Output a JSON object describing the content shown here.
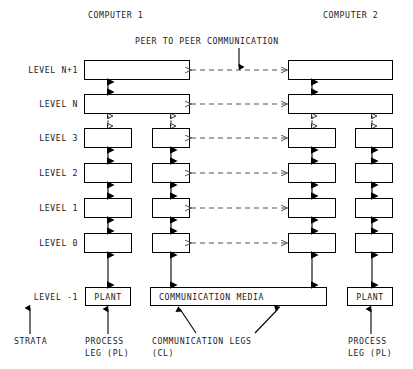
{
  "title_note": "Layered peer-to-peer communication architecture diagram",
  "headers": {
    "computer1": "COMPUTER 1",
    "computer2": "COMPUTER 2",
    "peer_note": "PEER TO PEER COMMUNICATION"
  },
  "levels": [
    {
      "label": "LEVEL N+1",
      "key": "n_plus_1",
      "kind": "wide"
    },
    {
      "label": "LEVEL N",
      "key": "n",
      "kind": "wide"
    },
    {
      "label": "LEVEL 3",
      "key": "l3",
      "kind": "split"
    },
    {
      "label": "LEVEL 2",
      "key": "l2",
      "kind": "split"
    },
    {
      "label": "LEVEL 1",
      "key": "l1",
      "kind": "split"
    },
    {
      "label": "LEVEL 0",
      "key": "l0",
      "kind": "split"
    },
    {
      "label": "LEVEL -1",
      "key": "lm1",
      "kind": "terminal"
    }
  ],
  "terminal_boxes": {
    "plant_left": "PLANT",
    "comm_media": "COMMUNICATION MEDIA",
    "plant_right": "PLANT"
  },
  "captions": {
    "strata": "STRATA",
    "process_leg_left_line1": "PROCESS",
    "process_leg_left_line2": "LEG (PL)",
    "comm_legs_line1": "COMMUNICATION LEGS",
    "comm_legs_line2": "(CL)",
    "process_leg_right_line1": "PROCESS",
    "process_leg_right_line2": "LEG (PL)"
  },
  "colors": {
    "ink": "#1a1a1a",
    "stroke": "#000000",
    "fill": "#ffffff"
  },
  "geometry": {
    "note": "pixel layout reference",
    "row_y": [
      60,
      94,
      128,
      163,
      198,
      233,
      287
    ],
    "box_height": 20,
    "comm_media_height": 20,
    "left_wide": [
      84,
      190
    ],
    "right_wide": [
      288,
      393
    ],
    "left_pl": [
      84,
      132
    ],
    "left_cl": [
      152,
      190
    ],
    "right_cl": [
      288,
      336
    ],
    "right_pl": [
      355,
      393
    ],
    "comm_media": [
      150,
      327
    ]
  }
}
